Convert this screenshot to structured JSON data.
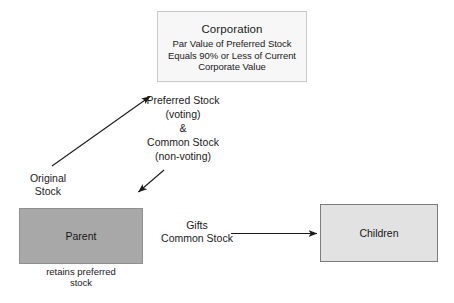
{
  "diagram": {
    "nodes": {
      "corporation": {
        "title": "Corporation",
        "detail": "Par Value of Preferred\nStock Equals 90% or Less of\nCurrent Corporate Value"
      },
      "parent": {
        "label": "Parent",
        "footnote": "retains preferred\nstock"
      },
      "children": {
        "label": "Children"
      }
    },
    "labels": {
      "original_stock": "Original\nStock",
      "stock_terms": "Preferred Stock\n(voting)\n&\nCommon Stock\n(non-voting)",
      "gifts": "Gifts\nCommon Stock"
    },
    "arrows": [
      {
        "name": "parent-to-corporation",
        "direction": "up-right",
        "label": "Original Stock"
      },
      {
        "name": "corporation-to-parent",
        "direction": "down-left",
        "label": "Preferred Stock & Common Stock"
      },
      {
        "name": "parent-to-children",
        "direction": "right",
        "label": "Gifts Common Stock"
      }
    ],
    "colors": {
      "background": "#ffffff",
      "corporation_fill": "#f7f7f7",
      "parent_fill": "#a8a8a8",
      "children_fill": "#e2e2e2",
      "stroke": "#1a1a1a",
      "text": "#1a1a1a"
    }
  }
}
